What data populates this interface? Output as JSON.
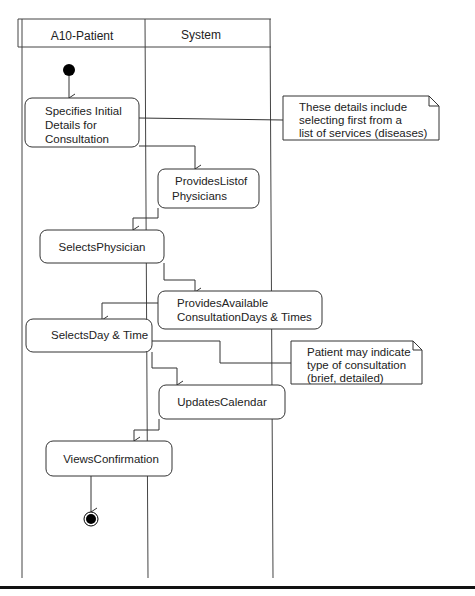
{
  "diagram": {
    "type": "UML activity diagram with swimlanes",
    "lanes": [
      {
        "id": "patient",
        "label": "A10-Patient"
      },
      {
        "id": "system",
        "label": "System"
      }
    ],
    "activities": [
      {
        "id": "a1",
        "lane": "patient",
        "lines": [
          "Specifies Initial",
          "Details for",
          "Consultation"
        ]
      },
      {
        "id": "a2",
        "lane": "system",
        "lines": [
          "ProvidesListof",
          "Physicians"
        ]
      },
      {
        "id": "a3",
        "lane": "patient",
        "lines": [
          "SelectsPhysician"
        ]
      },
      {
        "id": "a4",
        "lane": "system",
        "lines": [
          "ProvidesAvailable",
          "ConsultationDays & Times"
        ]
      },
      {
        "id": "a5",
        "lane": "patient",
        "lines": [
          "SelectsDay & Time"
        ]
      },
      {
        "id": "a6",
        "lane": "system",
        "lines": [
          "UpdatesCalendar"
        ]
      },
      {
        "id": "a7",
        "lane": "patient",
        "lines": [
          "ViewsConfirmation"
        ]
      }
    ],
    "notes": [
      {
        "id": "n1",
        "attached_to": "a1",
        "lines": [
          "These details include",
          "selecting first from a",
          "list of services (diseases)"
        ]
      },
      {
        "id": "n2",
        "attached_to": "a5",
        "lines": [
          "Patient may indicate",
          "type of consultation",
          "(brief, detailed)"
        ]
      }
    ],
    "flows": [
      [
        "start",
        "a1"
      ],
      [
        "a1",
        "a2"
      ],
      [
        "a2",
        "a3"
      ],
      [
        "a3",
        "a4"
      ],
      [
        "a4",
        "a5"
      ],
      [
        "a5",
        "a6"
      ],
      [
        "a6",
        "a7"
      ],
      [
        "a7",
        "end"
      ]
    ]
  }
}
